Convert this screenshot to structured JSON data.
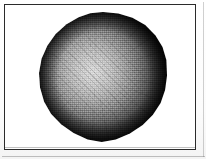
{
  "figure": {
    "kind": "scanned-figure",
    "caption": "",
    "frame": {
      "visible": true,
      "border_color": "#2b2b2b",
      "background_color": "#ffffff"
    },
    "paper": {
      "background_color": "#fdfdfd"
    },
    "subject": {
      "name": "shaded-sphere",
      "shape": "faceted-polygonal-sphere",
      "rendering": "dithered-grayscale-halftone",
      "highlight_position": "upper-left-of-center",
      "highlight_color": "#d9d9d9",
      "mid_tone_color": "#8f8f8f",
      "rim_color": "#0a0a0a",
      "center_x": 104,
      "center_y": 77,
      "diameter": 125
    }
  }
}
